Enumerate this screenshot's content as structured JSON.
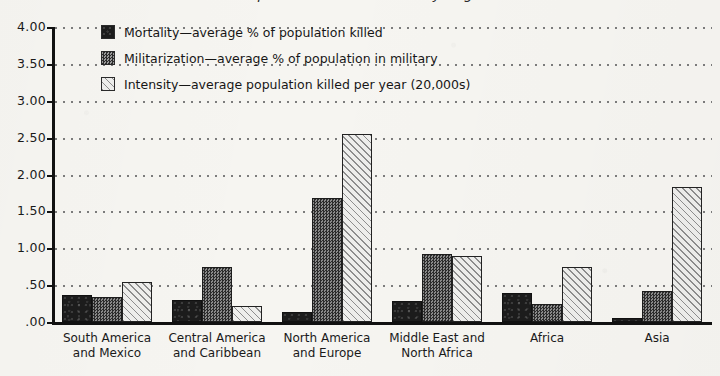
{
  "title": "Comparative Indices of War by Region",
  "chart_data": {
    "type": "bar",
    "title": "Comparative Indices of War by Region",
    "xlabel": "",
    "ylabel": "",
    "ylim": [
      0,
      4.0
    ],
    "ytick_labels": [
      "4.00",
      "3.50",
      "3.00",
      "2.50",
      "2.00",
      "1.50",
      "1.00",
      ".50",
      ".00"
    ],
    "ytick_values": [
      4.0,
      3.5,
      3.0,
      2.5,
      2.0,
      1.5,
      1.0,
      0.5,
      0.0
    ],
    "grid": true,
    "legend_position": "top-left inside",
    "categories": [
      "South America and Mexico",
      "Central America and Caribbean",
      "North America and Europe",
      "Middle East and North Africa",
      "Africa",
      "Asia"
    ],
    "category_lines": [
      [
        "South America",
        "and Mexico"
      ],
      [
        "Central America",
        "and Caribbean"
      ],
      [
        "North America",
        "and Europe"
      ],
      [
        "Middle East and",
        "North Africa"
      ],
      [
        "Africa",
        ""
      ],
      [
        "Asia",
        ""
      ]
    ],
    "series": [
      {
        "name": "Mortality—average % of population killed",
        "key": "mortality",
        "pattern": "solid-black",
        "values": [
          0.37,
          0.3,
          0.13,
          0.28,
          0.4,
          0.05
        ]
      },
      {
        "name": "Militarization—average % of population in military",
        "key": "militarization",
        "pattern": "dark-speckle",
        "values": [
          0.34,
          0.75,
          1.68,
          0.92,
          0.25,
          0.42
        ]
      },
      {
        "name": "Intensity—average population killed per year (20,000s)",
        "key": "intensity",
        "pattern": "diagonal-hatch",
        "values": [
          0.54,
          0.22,
          2.55,
          0.9,
          0.75,
          1.83
        ]
      }
    ]
  },
  "colors": {
    "background": "#f6f5f1",
    "axis": "#111111",
    "grid": "#7c7c7c",
    "mortality": "#1c1c1c",
    "militarization": "#4a4a4a",
    "intensity": "#e9e9e6"
  }
}
